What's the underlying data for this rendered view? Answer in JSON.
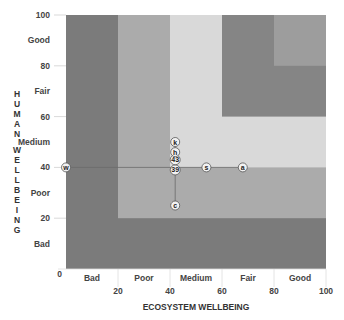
{
  "chart_data": {
    "type": "scatter",
    "title": "",
    "xlabel": "ECOSYSTEM WELLBEING",
    "ylabel": "HUMAN WELLBEING",
    "xlim": [
      0,
      100
    ],
    "ylim": [
      0,
      100
    ],
    "grid": false,
    "x_ticks": [
      0,
      20,
      40,
      60,
      80,
      100
    ],
    "y_ticks": [
      0,
      20,
      40,
      60,
      80,
      100
    ],
    "x_band_labels": [
      "Bad",
      "Poor",
      "Medium",
      "Fair",
      "Good"
    ],
    "y_band_labels": [
      "Bad",
      "Poor",
      "Medium",
      "Fair",
      "Good"
    ],
    "bands": [
      {
        "name": "Bad",
        "min": 0,
        "color": "#7b7b7b"
      },
      {
        "name": "Poor",
        "min": 20,
        "color": "#ababab"
      },
      {
        "name": "Medium",
        "min": 40,
        "color": "#d9d9d9"
      },
      {
        "name": "Fair",
        "min": 60,
        "color": "#858585"
      },
      {
        "name": "Good",
        "min": 80,
        "color": "#9d9d9d"
      }
    ],
    "points": [
      {
        "label": "w",
        "x": 0,
        "y": 40
      },
      {
        "label": "39",
        "x": 42,
        "y": 39
      },
      {
        "label": "43",
        "x": 42,
        "y": 43
      },
      {
        "label": "h",
        "x": 42,
        "y": 46
      },
      {
        "label": "k",
        "x": 42,
        "y": 50
      },
      {
        "label": "s",
        "x": 54,
        "y": 40
      },
      {
        "label": "a",
        "x": 68,
        "y": 40
      },
      {
        "label": "c",
        "x": 42,
        "y": 25
      }
    ],
    "connectors": [
      {
        "from": "w",
        "to": "a",
        "note": "horizontal line at human wellbeing ~40"
      },
      {
        "from": "c",
        "to": "k",
        "note": "vertical line at ecosystem wellbeing ~42"
      }
    ]
  }
}
